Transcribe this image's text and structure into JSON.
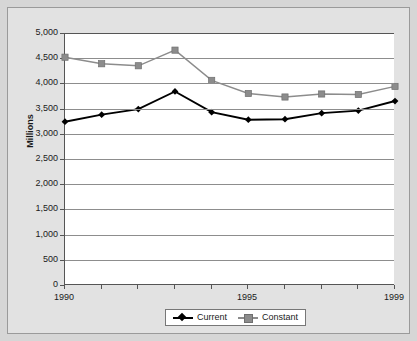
{
  "chart_data": {
    "type": "line",
    "title": "",
    "xlabel": "",
    "ylabel": "Millions",
    "x": [
      1990,
      1991,
      1992,
      1993,
      1994,
      1995,
      1996,
      1997,
      1998,
      1999
    ],
    "xtick_labels": [
      "1990",
      "",
      "",
      "",
      "",
      "1995",
      "",
      "",
      "",
      "1999"
    ],
    "xlim": [
      1990,
      1999
    ],
    "ylim": [
      0,
      5000
    ],
    "ytick_labels": [
      "5,000",
      "4,500",
      "4,000",
      "3,500",
      "3,000",
      "2,500",
      "2,000",
      "1,500",
      "1,000",
      "500",
      "0"
    ],
    "ytick_values": [
      5000,
      4500,
      4000,
      3500,
      3000,
      2500,
      2000,
      1500,
      1000,
      500,
      0
    ],
    "grid": true,
    "legend_position": "bottom",
    "series": [
      {
        "name": "Current",
        "color": "#000000",
        "marker": "diamond",
        "values": [
          3240,
          3380,
          3490,
          3840,
          3430,
          3280,
          3290,
          3410,
          3460,
          3650
        ]
      },
      {
        "name": "Constant",
        "color": "#8c8c8c",
        "marker": "square",
        "values": [
          4520,
          4390,
          4350,
          4660,
          4060,
          3800,
          3730,
          3790,
          3780,
          3940
        ]
      }
    ]
  },
  "colors": {
    "page_background": "#d6d6d6",
    "chart_background": "#e2e2e2",
    "plot_background": "#ffffff",
    "gridline": "#8d8d8d",
    "axis": "#555555",
    "current_series": "#000000",
    "constant_series": "#8c8c8c",
    "text": "#1a1a1a"
  }
}
